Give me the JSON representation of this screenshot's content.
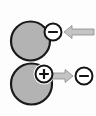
{
  "figure": {
    "background_color": "#fdfdfd",
    "width": 96,
    "height": 116,
    "colors": {
      "particle_fill": "#b3b3b3",
      "particle_stroke": "#1a1a1a",
      "charge_fill": "#ffffff",
      "charge_stroke": "#141414",
      "arrow_fill": "#c4c4c4",
      "arrow_stroke": "#8a8a8a"
    }
  },
  "panels": [
    {
      "id": "top",
      "name": "electron-attachment-panel",
      "particle": {
        "label": "",
        "cx": 30.5,
        "cy": 41,
        "r": 19.5,
        "notched": false
      },
      "charges": [
        {
          "id": "top-minus",
          "sign": "−",
          "semantic": "minus-charge",
          "cx": 53,
          "cy": 32,
          "r": 8.5
        }
      ],
      "arrow": {
        "id": "top-arrow",
        "direction": "left",
        "x1": 94,
        "x2": 64,
        "y": 32,
        "shaft_half_height": 3.0,
        "head_half_height": 6.5,
        "head_length": 8
      }
    },
    {
      "id": "bottom",
      "name": "electron-ejection-panel",
      "particle": {
        "label": "",
        "cx": 31.5,
        "cy": 84,
        "r": 20.5,
        "notched": true,
        "notch_cx": 44,
        "notch_cy": 74,
        "notch_r": 10.5
      },
      "charges": [
        {
          "id": "bottom-plus",
          "sign": "+",
          "semantic": "plus-charge",
          "cx": 44,
          "cy": 74,
          "r": 8.5
        },
        {
          "id": "bottom-minus",
          "sign": "−",
          "semantic": "minus-charge",
          "cx": 84,
          "cy": 76,
          "r": 8.5
        }
      ],
      "arrow": {
        "id": "bottom-arrow",
        "direction": "right",
        "x1": 50,
        "x2": 73,
        "y": 76,
        "shaft_half_height": 3.0,
        "head_half_height": 6.5,
        "head_length": 8
      }
    }
  ]
}
